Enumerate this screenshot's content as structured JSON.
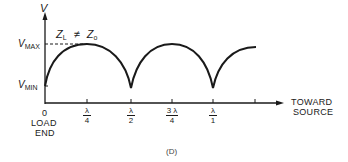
{
  "diagram": {
    "y_axis_label": "V",
    "v_max_label": "V",
    "v_max_sub": "MAX",
    "v_min_label": "V",
    "v_min_sub": "MIN",
    "condition": {
      "zl": "Z",
      "zl_sub": "L",
      "neq": "≠",
      "zo": "Z",
      "zo_sub": "o"
    },
    "x_ticks": [
      {
        "num": "λ",
        "den": "4"
      },
      {
        "num": "λ",
        "den": "2"
      },
      {
        "num": "3 λ",
        "den": "4"
      },
      {
        "num": "λ",
        "den": "1"
      }
    ],
    "origin_label": "0",
    "load_label_line1": "LOAD",
    "load_label_line2": "END",
    "direction_line1": "TOWARD",
    "direction_line2": "SOURCE",
    "caption": "(D)",
    "line_color": "#1a1a1a"
  }
}
